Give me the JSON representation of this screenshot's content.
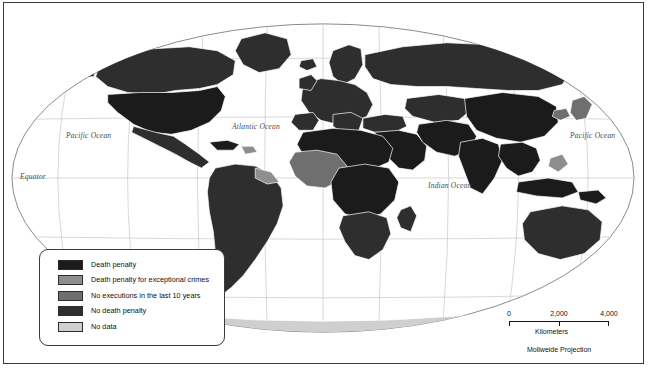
{
  "map": {
    "title": "World map of death penalty status",
    "projection_note": "Mollweide Projection",
    "geo_labels": {
      "pacific_left": "Pacific Ocean",
      "pacific_right": "Pacific Ocean",
      "atlantic": "Atlantic Ocean",
      "indian": "Indian Ocean",
      "equator": "Equator"
    },
    "colors": {
      "death_penalty": "#1b1b1b",
      "exceptional_crimes": "#8e8e8e",
      "no_executions_10_years": "#6f6f6f",
      "no_death_penalty": "#2e2e2e",
      "no_data": "#cfcfcf",
      "ocean": "#ffffff",
      "graticule": "#b9b9b9",
      "border": "#3a3a3a",
      "country_outline": "#ffffff"
    }
  },
  "legend": {
    "items": [
      {
        "label": "Death penalty",
        "color": "#1b1b1b"
      },
      {
        "label": "Death penalty for exceptional crimes",
        "color": "#8e8e8e"
      },
      {
        "label": "No executions in the last 10 years",
        "color": "#6f6f6f"
      },
      {
        "label": "No death penalty",
        "color": "#2e2e2e"
      },
      {
        "label": "No data",
        "color": "#cfcfcf"
      }
    ]
  },
  "scalebar": {
    "ticks": [
      "0",
      "2,000",
      "4,000"
    ],
    "units": "Kilometers"
  },
  "caption": {
    "text": ""
  }
}
